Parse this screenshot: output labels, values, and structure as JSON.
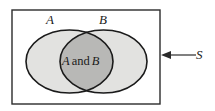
{
  "figure": {
    "type": "venn-diagram",
    "width": 215,
    "height": 111,
    "background_color": "#ffffff"
  },
  "universe": {
    "name": "sample-space-rectangle",
    "label": "S",
    "x": 12,
    "y": 10,
    "width": 148,
    "height": 94,
    "fill": "#ffffff",
    "stroke": "#2b2b2b",
    "stroke_width": 1.4
  },
  "sets": [
    {
      "id": "A",
      "label": "A",
      "cx": 69.5,
      "cy": 61.5,
      "rx": 43.5,
      "ry": 31.5,
      "fill": "#e2e2e0",
      "stroke": "#1a1a1a",
      "stroke_width": 1.6,
      "label_x": 46,
      "label_y": 13
    },
    {
      "id": "B",
      "label": "B",
      "cx": 103.5,
      "cy": 61.5,
      "rx": 43.5,
      "ry": 31.5,
      "fill": "#e2e2e0",
      "stroke": "#1a1a1a",
      "stroke_width": 1.6,
      "label_x": 99,
      "label_y": 13
    }
  ],
  "intersection": {
    "label_parts": {
      "left": "A",
      "conjunction": "and",
      "right": "B"
    },
    "full_label": "A and B",
    "fill": "#b8b8b6",
    "label_x": 62,
    "label_y": 55
  },
  "annotation": {
    "name": "sample-space-callout",
    "label": "S",
    "arrow": {
      "direction": "left",
      "tail_x": 196,
      "head_x": 161,
      "y": 55,
      "color": "#2b2b2b"
    },
    "label_x": 196,
    "label_y": 48
  },
  "colors": {
    "outline": "#1a1a1a",
    "rect_outline": "#2b2b2b",
    "set_only_fill": "#e2e2e0",
    "overlap_fill": "#b8b8b6",
    "page_background": "#ffffff",
    "text": "#1a1a1a"
  }
}
